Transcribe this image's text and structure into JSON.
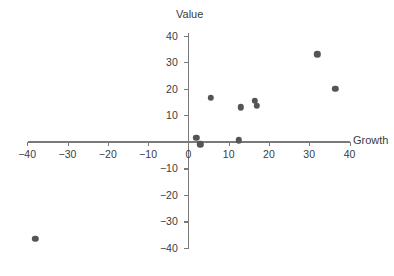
{
  "chart_data": {
    "type": "scatter",
    "title": "",
    "xlabel": "Growth",
    "ylabel": "Value",
    "xlim": [
      -40,
      40
    ],
    "ylim": [
      -40,
      40
    ],
    "xticks": [
      -40,
      -30,
      -20,
      -10,
      0,
      10,
      20,
      30,
      40
    ],
    "xtick_labels": [
      "−40",
      "−30",
      "−20",
      "−10",
      "0",
      "10",
      "20",
      "30",
      "40"
    ],
    "yticks": [
      -40,
      -30,
      -20,
      -10,
      0,
      10,
      20,
      30,
      40
    ],
    "ytick_labels": [
      "−40",
      "−30",
      "−20",
      "−10",
      "0",
      "10",
      "20",
      "30",
      "40"
    ],
    "grid": false,
    "legend": false,
    "axes_style": "centered-cross",
    "marker_color": "#555558",
    "axis_color": "#7a7a7a",
    "text_color": "#3b3b3b",
    "points": [
      {
        "x": -38.0,
        "y": -36.5
      },
      {
        "x": 2.0,
        "y": 1.5
      },
      {
        "x": 3.0,
        "y": -1.0
      },
      {
        "x": 5.5,
        "y": 16.5
      },
      {
        "x": 12.5,
        "y": 0.5
      },
      {
        "x": 13.0,
        "y": 13.0
      },
      {
        "x": 16.5,
        "y": 15.5
      },
      {
        "x": 17.0,
        "y": 13.5
      },
      {
        "x": 32.0,
        "y": 33.0
      },
      {
        "x": 36.5,
        "y": 20.0
      }
    ]
  }
}
